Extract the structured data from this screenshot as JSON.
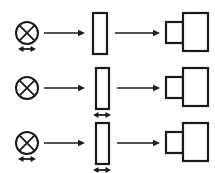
{
  "figure": {
    "background_color": "#ffffff",
    "stroke_color": "#1a1a1a",
    "width": 215,
    "height": 173,
    "row_count": 3
  },
  "legend_symbols": [
    {
      "name": "crossed-circle",
      "meaning": "light source",
      "description": "circle with diagonal cross inside"
    },
    {
      "name": "tall-rectangle",
      "meaning": "sample / aperture",
      "description": "narrow upright open rectangle"
    },
    {
      "name": "detector",
      "meaning": "detector",
      "description": "small square joined to a larger square"
    },
    {
      "name": "double-headed-arrow",
      "meaning": "translatable element",
      "description": "short horizontal line with arrowheads at both ends"
    },
    {
      "name": "single-arrow",
      "meaning": "beam direction",
      "description": "horizontal line with a solid arrowhead pointing right"
    }
  ],
  "rows": [
    {
      "id": "row-1",
      "label": "Configuration 1",
      "center_y": 33,
      "source": {
        "name": "light-source",
        "symbol": "crossed-circle",
        "cx": 27,
        "cy": 33,
        "r": 11,
        "movable": true
      },
      "arrow_1": {
        "name": "beam-arrow-source-to-sample",
        "x1": 44,
        "x2": 85,
        "y": 33
      },
      "sample": {
        "name": "sample-aperture",
        "symbol": "tall-rectangle",
        "x": 93,
        "y": 13,
        "width": 14,
        "height": 41,
        "movable": false
      },
      "arrow_2": {
        "name": "beam-arrow-sample-to-detector",
        "x1": 115,
        "x2": 160,
        "y": 33
      },
      "detector": {
        "name": "detector",
        "symbol": "detector",
        "small_x": 166,
        "small_y": 22,
        "small_w": 17,
        "small_h": 21,
        "large_x": 183,
        "large_y": 13,
        "large_w": 25,
        "large_h": 38
      },
      "source_double_arrow": {
        "name": "source-translation-arrow",
        "visible": true,
        "cx": 27,
        "y": 49,
        "half_width": 9
      },
      "sample_double_arrow": {
        "name": "sample-translation-arrow",
        "visible": false,
        "cx": 100,
        "y": 60,
        "half_width": 9
      }
    },
    {
      "id": "row-2",
      "label": "Configuration 2",
      "center_y": 88,
      "source": {
        "name": "light-source",
        "symbol": "crossed-circle",
        "cx": 27,
        "cy": 88,
        "r": 11,
        "movable": false
      },
      "arrow_1": {
        "name": "beam-arrow-source-to-sample",
        "x1": 44,
        "x2": 85,
        "y": 88
      },
      "sample": {
        "name": "sample-aperture",
        "symbol": "tall-rectangle",
        "x": 96,
        "y": 68,
        "width": 13,
        "height": 41,
        "movable": true
      },
      "arrow_2": {
        "name": "beam-arrow-sample-to-detector",
        "x1": 117,
        "x2": 160,
        "y": 88
      },
      "detector": {
        "name": "detector",
        "symbol": "detector",
        "small_x": 166,
        "small_y": 77,
        "small_w": 17,
        "small_h": 21,
        "large_x": 183,
        "large_y": 68,
        "large_w": 25,
        "large_h": 38
      },
      "source_double_arrow": {
        "name": "source-translation-arrow",
        "visible": false,
        "cx": 27,
        "y": 104,
        "half_width": 9
      },
      "sample_double_arrow": {
        "name": "sample-translation-arrow",
        "visible": true,
        "cx": 102,
        "y": 115,
        "half_width": 9
      }
    },
    {
      "id": "row-3",
      "label": "Configuration 3",
      "center_y": 143,
      "source": {
        "name": "light-source",
        "symbol": "crossed-circle",
        "cx": 27,
        "cy": 143,
        "r": 11,
        "movable": true
      },
      "arrow_1": {
        "name": "beam-arrow-source-to-sample",
        "x1": 44,
        "x2": 85,
        "y": 143
      },
      "sample": {
        "name": "sample-aperture",
        "symbol": "tall-rectangle",
        "x": 96,
        "y": 123,
        "width": 13,
        "height": 41,
        "movable": true
      },
      "arrow_2": {
        "name": "beam-arrow-sample-to-detector",
        "x1": 117,
        "x2": 160,
        "y": 143
      },
      "detector": {
        "name": "detector",
        "symbol": "detector",
        "small_x": 166,
        "small_y": 132,
        "small_w": 17,
        "small_h": 21,
        "large_x": 183,
        "large_y": 123,
        "large_w": 25,
        "large_h": 38
      },
      "source_double_arrow": {
        "name": "source-translation-arrow",
        "visible": true,
        "cx": 27,
        "y": 159,
        "half_width": 9
      },
      "sample_double_arrow": {
        "name": "sample-translation-arrow",
        "visible": true,
        "cx": 102,
        "y": 170,
        "half_width": 9
      }
    }
  ]
}
